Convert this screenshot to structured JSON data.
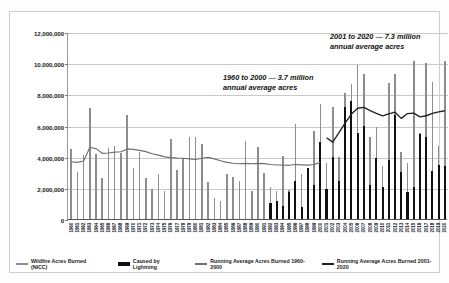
{
  "chart_data": {
    "type": "bar",
    "title": "",
    "xlabel": "",
    "ylabel": "",
    "ylim": [
      0,
      12000000
    ],
    "ytick_values": [
      0,
      2000000,
      4000000,
      6000000,
      8000000,
      10000000,
      12000000
    ],
    "ytick_labels": [
      "0",
      "2,000,000",
      "4,000,000",
      "6,000,000",
      "8,000,000",
      "10,000,000",
      "12,000,000"
    ],
    "grid": true,
    "legend_position": "bottom",
    "categories": [
      "1960",
      "1961",
      "1962",
      "1963",
      "1964",
      "1965",
      "1966",
      "1967",
      "1968",
      "1969",
      "1970",
      "1971",
      "1972",
      "1973",
      "1974",
      "1975",
      "1976",
      "1977",
      "1978",
      "1979",
      "1980",
      "1981",
      "1982",
      "1983",
      "1984",
      "1985",
      "1986",
      "1987",
      "1988",
      "1989",
      "1990",
      "1991",
      "1992",
      "1993",
      "1994",
      "1995",
      "1996",
      "1997",
      "1998",
      "1999",
      "2000",
      "2001",
      "2002",
      "2003",
      "2004",
      "2005",
      "2006",
      "2007",
      "2008",
      "2009",
      "2010",
      "2011",
      "2012",
      "2013",
      "2014",
      "2015",
      "2016",
      "2017",
      "2018",
      "2019",
      "2020"
    ],
    "series": [
      {
        "name": "Wildfire Acres Burned (NICC)",
        "color": "#8d8d8d",
        "type": "bar",
        "values": [
          4478188,
          3036219,
          4078894,
          7120768,
          4197309,
          2652112,
          4574389,
          4658586,
          4231996,
          6689081,
          3278565,
          4278472,
          2641166,
          1915273,
          2879095,
          1791327,
          5109240,
          3152644,
          3910913,
          5260825,
          5260825,
          4814206,
          2382036,
          1323666,
          1148409,
          2896147,
          2719162,
          2447296,
          5009290,
          1827310,
          4621621,
          2953578,
          2069929,
          1797574,
          4073579,
          1840546,
          6065998,
          2856959,
          1329704,
          5626093,
          7393493,
          3570911,
          7184712,
          3960842,
          8097880,
          8689389,
          9873745,
          9328045,
          5292468,
          5921786,
          3422724,
          8711367,
          9326238,
          4319546,
          3595613,
          10125149,
          5509995,
          10026086,
          8767492,
          4664364,
          10122336
        ]
      },
      {
        "name": "Caused by Lightning",
        "color": "#111111",
        "type": "bar",
        "values": [
          0,
          0,
          0,
          0,
          0,
          0,
          0,
          0,
          0,
          0,
          0,
          0,
          0,
          0,
          0,
          0,
          0,
          0,
          0,
          0,
          0,
          0,
          0,
          0,
          0,
          0,
          0,
          0,
          0,
          0,
          0,
          0,
          1043000,
          1137000,
          846000,
          1732000,
          2424000,
          751000,
          3262000,
          2203000,
          4945000,
          1905000,
          4005000,
          2428000,
          7185000,
          7560000,
          5512000,
          5970000,
          2211000,
          3908000,
          2030000,
          3763000,
          6705000,
          3007000,
          1751000,
          2037000,
          5430000,
          5238000,
          3085000,
          3449000,
          3422000
        ]
      },
      {
        "name": "Running Average Acres Burned 1960-2000",
        "color": "#6f6f6f",
        "type": "line",
        "values": [
          3740000,
          3700000,
          3790000,
          4650000,
          4580000,
          4280000,
          4300000,
          4360000,
          4380000,
          4560000,
          4530000,
          4470000,
          4390000,
          4250000,
          4160000,
          4050000,
          4000000,
          3970000,
          3960000,
          3920000,
          3880000,
          3960000,
          4020000,
          3920000,
          3800000,
          3700000,
          3640000,
          3610000,
          3630000,
          3610000,
          3630000,
          3620000,
          3560000,
          3530000,
          3530000,
          3510000,
          3560000,
          3540000,
          3520000,
          3560000,
          3700000,
          null,
          null,
          null,
          null,
          null,
          null,
          null,
          null,
          null,
          null,
          null,
          null,
          null,
          null,
          null,
          null,
          null,
          null,
          null,
          null
        ]
      },
      {
        "name": "Running Average Acres Burned 2001-2020",
        "color": "#222222",
        "type": "line",
        "values": [
          null,
          null,
          null,
          null,
          null,
          null,
          null,
          null,
          null,
          null,
          null,
          null,
          null,
          null,
          null,
          null,
          null,
          null,
          null,
          null,
          null,
          null,
          null,
          null,
          null,
          null,
          null,
          null,
          null,
          null,
          null,
          null,
          null,
          null,
          null,
          null,
          null,
          null,
          null,
          null,
          null,
          5280000,
          5000000,
          5600000,
          6230000,
          6800000,
          7170000,
          7230000,
          7020000,
          6840000,
          6680000,
          6810000,
          6920000,
          6520000,
          6830000,
          6860000,
          6620000,
          6690000,
          6840000,
          6940000,
          7010000
        ]
      }
    ],
    "annotations": [
      {
        "id": "annot-1960-2000",
        "line1": "1960 to 2000 — 3.7 million",
        "line2": "annual average acres"
      },
      {
        "id": "annot-2001-2020",
        "line1": "2001 to 2020 — 7.3 million",
        "line2": "annual average acres"
      }
    ]
  },
  "legend": {
    "items": [
      {
        "label": "Wildfire Acres Burned (NICC)",
        "swatch": "gray-bar-swatch"
      },
      {
        "label": "Caused by Lightning",
        "swatch": "black-bar-swatch"
      },
      {
        "label": "Running Average Acres Burned 1960-2000",
        "swatch": "gray-line-swatch"
      },
      {
        "label": "Running Average Acres Burned 2001-2020",
        "swatch": "black-line-swatch"
      }
    ]
  }
}
